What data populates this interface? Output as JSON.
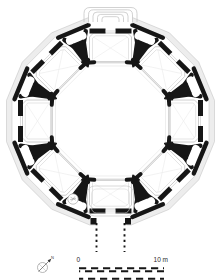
{
  "figure": {
    "type": "architectural-floor-plan",
    "colors": {
      "ink": "#161616",
      "wall_band_fill": "#ededed",
      "wall_band_edge": "#bdbdbd",
      "room_line": "#c2c2c2",
      "faint_line": "#e0e0e0"
    }
  },
  "scale_bar": {
    "start_label": "0",
    "end_label": "10 m"
  },
  "compass": {
    "north_label": "N"
  }
}
